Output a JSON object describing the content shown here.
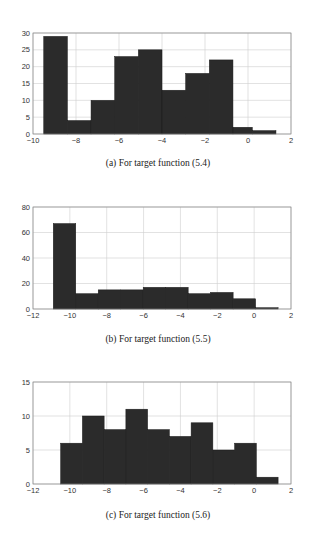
{
  "chart_data": [
    {
      "type": "bar",
      "id": "a",
      "caption": "(a) For target function (5.4)",
      "bin_edges": [
        -9.5,
        -8.4,
        -7.3,
        -6.2,
        -5.1,
        -4.0,
        -2.9,
        -1.8,
        -0.7,
        0.2,
        1.3
      ],
      "values": [
        29,
        4,
        10,
        23,
        25,
        13,
        18,
        22,
        2,
        1
      ],
      "xlim": [
        -10,
        2
      ],
      "ylim": [
        0,
        30
      ],
      "xticks": [
        -10,
        -8,
        -6,
        -4,
        -2,
        0,
        2
      ],
      "yticks": [
        0,
        5,
        10,
        15,
        20,
        25,
        30
      ],
      "grid": true,
      "title": "",
      "xlabel": "",
      "ylabel": ""
    },
    {
      "type": "bar",
      "id": "b",
      "caption": "(b) For target function (5.5)",
      "bin_edges": [
        -10.9,
        -9.68,
        -8.46,
        -7.24,
        -6.02,
        -4.8,
        -3.58,
        -2.36,
        -1.14,
        0.08,
        1.3
      ],
      "values": [
        67,
        12,
        15,
        15,
        17,
        17,
        12,
        13,
        8,
        1
      ],
      "xlim": [
        -12,
        2
      ],
      "ylim": [
        0,
        80
      ],
      "xticks": [
        -12,
        -10,
        -8,
        -6,
        -4,
        -2,
        0,
        2
      ],
      "yticks": [
        0,
        20,
        40,
        60,
        80
      ],
      "grid": true,
      "title": "",
      "xlabel": "",
      "ylabel": ""
    },
    {
      "type": "bar",
      "id": "c",
      "caption": "(c) For target function (5.6)",
      "bin_edges": [
        -10.5,
        -9.32,
        -8.14,
        -6.96,
        -5.78,
        -4.6,
        -3.42,
        -2.24,
        -1.06,
        0.12,
        1.3
      ],
      "values": [
        6,
        10,
        8,
        11,
        8,
        7,
        9,
        5,
        6,
        1
      ],
      "xlim": [
        -12,
        2
      ],
      "ylim": [
        0,
        15
      ],
      "xticks": [
        -12,
        -10,
        -8,
        -6,
        -4,
        -2,
        0,
        2
      ],
      "yticks": [
        0,
        5,
        10,
        15
      ],
      "grid": true,
      "title": "",
      "xlabel": "",
      "ylabel": ""
    }
  ],
  "captions": {
    "a": "(a) For target function (5.4)",
    "b": "(b) For target function (5.5)",
    "c": "(c) For target function (5.6)"
  },
  "style": {
    "bar_color": "#2b2b2b",
    "grid_color": "#cfcfcf",
    "axis_color": "#888888"
  }
}
